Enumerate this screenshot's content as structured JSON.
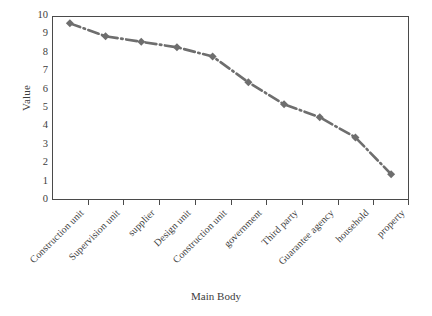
{
  "chart_data": {
    "type": "line",
    "title": "",
    "xlabel": "Main Body",
    "ylabel": "Value",
    "categories": [
      "Construction unit",
      "Supervision unit",
      "supplier",
      "Design unit",
      "Construction unit",
      "government",
      "Third party",
      "Guarantee agency",
      "household",
      "property"
    ],
    "values": [
      9.6,
      8.9,
      8.6,
      8.3,
      7.8,
      6.4,
      5.2,
      4.5,
      3.4,
      1.4
    ],
    "ylim": [
      0,
      10
    ],
    "ytick_labels": [
      "10",
      "9",
      "8",
      "7",
      "6",
      "5",
      "4",
      "3",
      "2",
      "1",
      "0"
    ],
    "ytick_values": [
      10,
      9,
      8,
      7,
      6,
      5,
      4,
      3,
      2,
      1,
      0
    ],
    "grid": false,
    "legend": false,
    "series_color": "#6e6e6e",
    "axis_color": "#4a4a4a",
    "marker": "diamond",
    "line_style": "dash-dot"
  }
}
